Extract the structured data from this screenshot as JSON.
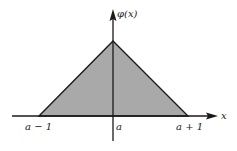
{
  "figure": {
    "type": "hat-function",
    "colors": {
      "fill": "#a9a9a9",
      "stroke": "#1a1a1a",
      "background": "#ffffff"
    },
    "axes": {
      "y_label": "φ(x)",
      "x_label": "x"
    },
    "ticks": [
      {
        "label": "a − 1",
        "position": "left-base"
      },
      {
        "label": "a",
        "position": "center"
      },
      {
        "label": "a + 1",
        "position": "right-base"
      }
    ],
    "shape": {
      "apex": [
        113,
        41
      ],
      "left_base": [
        39,
        116
      ],
      "right_base": [
        188,
        116
      ]
    }
  }
}
